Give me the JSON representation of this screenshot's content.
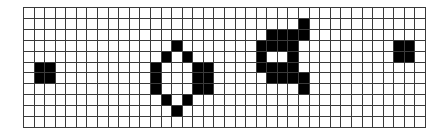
{
  "grid": {
    "cols": 38,
    "rows": 11,
    "cell_fill_color": "#000000",
    "empty_color": "#ffffff",
    "line_color": "#3a3a3a",
    "filled_cells": [
      [
        5,
        1
      ],
      [
        5,
        2
      ],
      [
        6,
        1
      ],
      [
        6,
        2
      ],
      [
        3,
        14
      ],
      [
        4,
        13
      ],
      [
        4,
        15
      ],
      [
        5,
        12
      ],
      [
        5,
        16
      ],
      [
        5,
        17
      ],
      [
        6,
        12
      ],
      [
        6,
        16
      ],
      [
        6,
        17
      ],
      [
        7,
        12
      ],
      [
        7,
        16
      ],
      [
        7,
        17
      ],
      [
        8,
        13
      ],
      [
        8,
        15
      ],
      [
        9,
        14
      ],
      [
        1,
        26
      ],
      [
        2,
        23
      ],
      [
        2,
        24
      ],
      [
        2,
        25
      ],
      [
        2,
        26
      ],
      [
        3,
        22
      ],
      [
        3,
        23
      ],
      [
        3,
        24
      ],
      [
        3,
        25
      ],
      [
        4,
        22
      ],
      [
        4,
        25
      ],
      [
        5,
        22
      ],
      [
        5,
        23
      ],
      [
        5,
        24
      ],
      [
        5,
        25
      ],
      [
        6,
        23
      ],
      [
        6,
        24
      ],
      [
        6,
        25
      ],
      [
        6,
        26
      ],
      [
        7,
        26
      ],
      [
        3,
        35
      ],
      [
        3,
        36
      ],
      [
        4,
        35
      ],
      [
        4,
        36
      ]
    ]
  }
}
